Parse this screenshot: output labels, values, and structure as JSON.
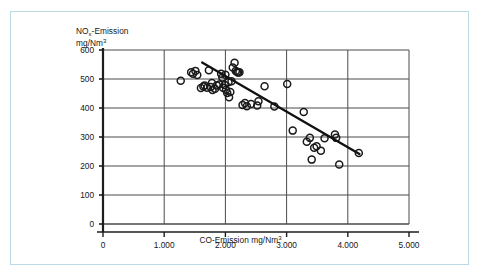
{
  "chart_data": {
    "type": "scatter",
    "title": "",
    "xlabel": "CO-Emission mg/Nm3",
    "ylabel": "NOx-Emission mg/Nm3",
    "xlabel_parts": {
      "pre": "CO-Emission mg/Nm",
      "sup": "3"
    },
    "ylabel_parts": {
      "pre": "NO",
      "sub": "x",
      "mid": "-Emission",
      "line2_pre": "mg/Nm",
      "line2_sup": "3"
    },
    "xlim": [
      0,
      5000
    ],
    "ylim": [
      0,
      600
    ],
    "xticks": [
      0,
      1000,
      2000,
      3000,
      4000,
      5000
    ],
    "yticks": [
      0,
      100,
      200,
      300,
      400,
      500,
      600
    ],
    "xtick_labels": [
      "0",
      "1.000",
      "2.000",
      "3.000",
      "4.000",
      "5.000"
    ],
    "ytick_labels": [
      "0",
      "100",
      "200",
      "300",
      "400",
      "500",
      "600"
    ],
    "grid": true,
    "legend": "none",
    "marker": "open-circle",
    "series": [
      {
        "name": "NOx vs CO emission",
        "x": [
          1270,
          1440,
          1470,
          1510,
          1540,
          1600,
          1640,
          1660,
          1700,
          1730,
          1760,
          1780,
          1790,
          1830,
          1860,
          1900,
          1930,
          1950,
          1960,
          1990,
          2000,
          2010,
          2030,
          2050,
          2060,
          2080,
          2100,
          2120,
          2150,
          2170,
          2190,
          2210,
          2230,
          2280,
          2320,
          2350,
          2420,
          2520,
          2540,
          2640,
          2800,
          3010,
          3100,
          3280,
          3330,
          3380,
          3410,
          3450,
          3490,
          3560,
          3620,
          3790,
          3810,
          3860,
          4180
        ],
        "y": [
          494,
          523,
          518,
          528,
          514,
          469,
          474,
          478,
          470,
          530,
          472,
          486,
          462,
          466,
          478,
          481,
          518,
          505,
          470,
          479,
          515,
          463,
          452,
          489,
          437,
          455,
          492,
          540,
          556,
          528,
          524,
          522,
          523,
          410,
          417,
          406,
          414,
          409,
          423,
          475,
          405,
          483,
          322,
          386,
          284,
          297,
          222,
          263,
          268,
          253,
          296,
          309,
          297,
          205,
          245
        ]
      }
    ],
    "trendline": {
      "name": "linear regression",
      "x_start": 1620,
      "y_start": 557,
      "x_end": 4190,
      "y_end": 241
    }
  }
}
